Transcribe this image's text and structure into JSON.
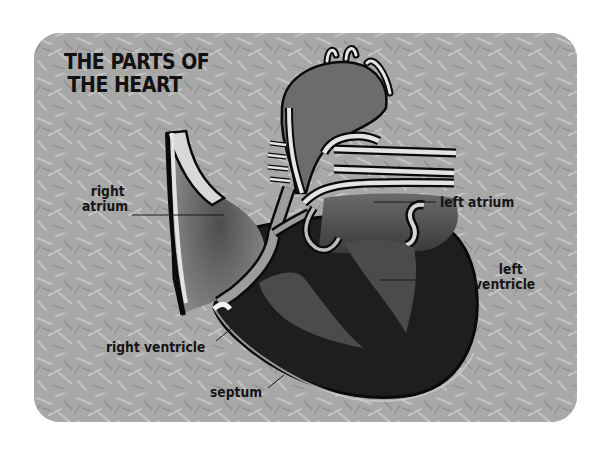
{
  "title": {
    "line1": "THE PARTS OF",
    "line2": "THE HEART"
  },
  "labels": {
    "right_atrium": {
      "line1": "right",
      "line2": "atrium"
    },
    "left_atrium": "left atrium",
    "left_ventricle": {
      "line1": "left",
      "line2": "ventricle"
    },
    "right_ventricle": "right ventricle",
    "septum": "septum"
  },
  "colors": {
    "background_card": "#a9a9a9",
    "heart_dark": "#1e1e1e",
    "heart_mid": "#4a4a4a",
    "vessel_light": "#dcdcdc",
    "outline": "#0a0a0a"
  }
}
